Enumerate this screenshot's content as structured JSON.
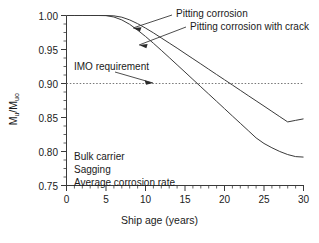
{
  "chart_data": {
    "type": "line",
    "title": "",
    "xlabel": "Ship age (years)",
    "ylabel": "Mu/Muo",
    "ylabel_main": "M",
    "ylabel_sub1": "u",
    "ylabel_sep": "/M",
    "ylabel_sub2": "uo",
    "xlim": [
      0,
      30
    ],
    "ylim": [
      0.75,
      1.0
    ],
    "xticks": [
      0,
      5,
      10,
      15,
      20,
      25,
      30
    ],
    "xtick_labels": [
      "0",
      "5",
      "10",
      "15",
      "20",
      "25",
      "30"
    ],
    "xminor_step": 1,
    "yticks": [
      0.75,
      0.8,
      0.85,
      0.9,
      0.95,
      1.0
    ],
    "ytick_labels": [
      "0.75",
      "0.80",
      "0.85",
      "0.90",
      "0.95",
      "1.00"
    ],
    "yminor_step": 0.0125,
    "grid": false,
    "legend_position": "inline-annotations",
    "series": [
      {
        "name": "Pitting corrosion",
        "color": "#3a3a3a",
        "x": [
          0,
          1,
          2,
          3,
          4,
          5,
          6,
          7,
          8,
          9,
          10,
          11,
          12,
          13,
          14,
          15,
          16,
          17,
          18,
          19,
          20,
          21,
          22,
          23,
          24,
          25,
          26,
          27,
          28,
          29,
          30
        ],
        "y": [
          1.0,
          1.0,
          1.0,
          1.0,
          1.0,
          1.0,
          0.9995,
          0.9975,
          0.9935,
          0.988,
          0.9815,
          0.9745,
          0.967,
          0.9595,
          0.952,
          0.9442,
          0.9365,
          0.9288,
          0.921,
          0.9132,
          0.9055,
          0.8978,
          0.89,
          0.8822,
          0.8745,
          0.8668,
          0.859,
          0.8512,
          0.8435,
          0.8458,
          0.848
        ]
      },
      {
        "name": "Pitting corrosion with crack",
        "color": "#3a3a3a",
        "x": [
          0,
          1,
          2,
          3,
          4,
          5,
          6,
          7,
          8,
          9,
          10,
          11,
          12,
          13,
          14,
          15,
          16,
          17,
          18,
          19,
          20,
          21,
          22,
          23,
          24,
          25,
          26,
          27,
          28,
          29,
          30
        ],
        "y": [
          1.0,
          1.0,
          1.0,
          1.0,
          1.0,
          0.9998,
          0.9978,
          0.9935,
          0.987,
          0.9785,
          0.9692,
          0.9592,
          0.9488,
          0.9382,
          0.9275,
          0.9168,
          0.906,
          0.8952,
          0.8845,
          0.8738,
          0.863,
          0.8522,
          0.8415,
          0.8308,
          0.82,
          0.8118,
          0.8055,
          0.8,
          0.7955,
          0.7925,
          0.7918
        ]
      }
    ],
    "reference_line": {
      "label": "IMO requirement",
      "value": 0.9,
      "style": "dotted",
      "color": "#777777"
    },
    "annotations": [
      {
        "name": "pitting-corrosion",
        "text": "Pitting corrosion"
      },
      {
        "name": "pitting-corrosion-with-crack",
        "text": "Pitting corrosion with crack"
      },
      {
        "name": "imo-requirement",
        "text": "IMO requirement"
      }
    ],
    "case_notes": [
      "Bulk carrier",
      "Sagging",
      "Average corrosion rate"
    ]
  }
}
